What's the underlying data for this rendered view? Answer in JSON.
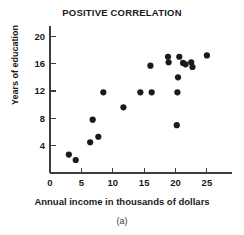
{
  "chart_data": {
    "type": "scatter",
    "title": "POSITIVE CORRELATION",
    "xlabel": "Annual income in thousands of dollars",
    "ylabel": "Years of education",
    "caption": "(a)",
    "xlim": [
      0,
      29
    ],
    "ylim": [
      0,
      21.5
    ],
    "xticks": [
      0,
      5,
      10,
      15,
      20,
      25
    ],
    "yticks": [
      4,
      8,
      12,
      16,
      20
    ],
    "xtick_labels": [
      "0",
      "5",
      "10",
      "15",
      "20",
      "25"
    ],
    "ytick_labels": [
      "4",
      "8",
      "12",
      "16",
      "20"
    ],
    "grid": false,
    "legend": false,
    "marker_color": "#1a1a1a",
    "marker_size": 3.1,
    "axis_color": "#3d3d3d",
    "points": [
      {
        "x": 3.0,
        "y": 2.7
      },
      {
        "x": 4.1,
        "y": 1.9
      },
      {
        "x": 6.4,
        "y": 4.5
      },
      {
        "x": 6.8,
        "y": 7.8
      },
      {
        "x": 7.7,
        "y": 5.3
      },
      {
        "x": 8.5,
        "y": 11.8
      },
      {
        "x": 11.7,
        "y": 9.6
      },
      {
        "x": 14.4,
        "y": 11.8
      },
      {
        "x": 16.0,
        "y": 15.7
      },
      {
        "x": 16.2,
        "y": 11.8
      },
      {
        "x": 18.8,
        "y": 17.0
      },
      {
        "x": 18.9,
        "y": 16.2
      },
      {
        "x": 20.2,
        "y": 7.0
      },
      {
        "x": 20.3,
        "y": 11.8
      },
      {
        "x": 20.4,
        "y": 14.0
      },
      {
        "x": 20.6,
        "y": 17.0
      },
      {
        "x": 21.2,
        "y": 16.1
      },
      {
        "x": 21.6,
        "y": 15.9
      },
      {
        "x": 22.5,
        "y": 16.2
      },
      {
        "x": 22.7,
        "y": 15.5
      },
      {
        "x": 25.0,
        "y": 17.2
      }
    ]
  }
}
